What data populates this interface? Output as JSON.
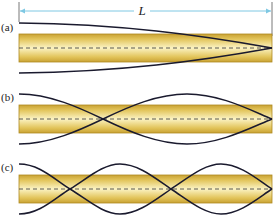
{
  "figure": {
    "length_label": "L",
    "panels": [
      {
        "id": "a",
        "label": "(a)",
        "half_wavelengths": 0.5,
        "description": "closed-open pipe, fundamental"
      },
      {
        "id": "b",
        "label": "(b)",
        "half_wavelengths": 1.5,
        "description": "third harmonic"
      },
      {
        "id": "c",
        "label": "(c)",
        "half_wavelengths": 2.5,
        "description": "fifth harmonic"
      }
    ],
    "colors": {
      "pipe_fill_light": "#f6eaa8",
      "pipe_fill_dark": "#d2ac3c",
      "pipe_border": "#b08a22",
      "wave": "#1a1a2e",
      "dimension_line": "#7ec8e3",
      "axis_dash": "#333333"
    }
  }
}
